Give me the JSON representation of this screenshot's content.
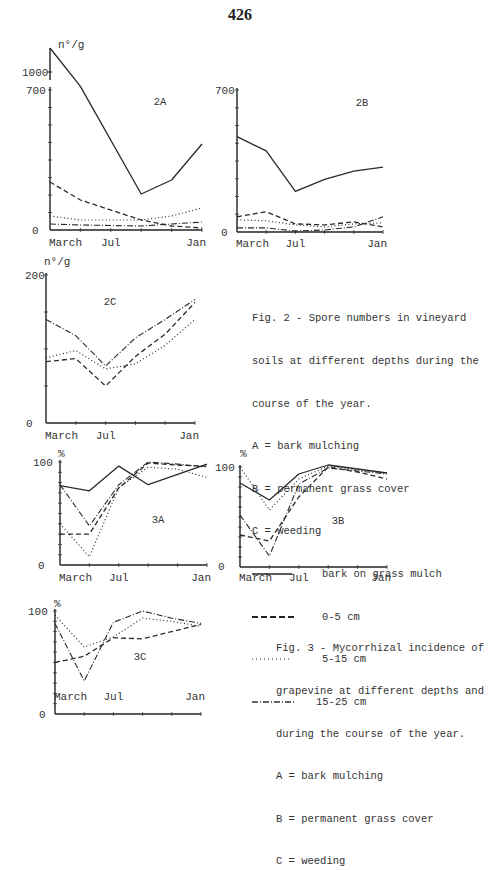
{
  "page": {
    "number": "426"
  },
  "legend_styles": [
    {
      "key": "bark",
      "label": "bark on grass mulch",
      "dash": "",
      "width": 1.3
    },
    {
      "key": "d0_5",
      "label": "0-5 cm",
      "dash": "5,3",
      "width": 1.3
    },
    {
      "key": "d5_15",
      "label": "5-15 cm",
      "dash": "1,2.5",
      "width": 1.2
    },
    {
      "key": "d15_25",
      "label": "15-25 cm",
      "dash": "6,2,1,2",
      "width": 1.1
    }
  ],
  "fig2_caption": {
    "lines": [
      "Fig. 2 - Spore numbers in vineyard",
      "soils at different depths during the",
      "course of the year.",
      "A = bark mulching",
      "B = permanent grass cover",
      "C = weeding"
    ],
    "legend": [
      {
        "label": "bark on grass mulch"
      },
      {
        "label": "0-5 cm"
      },
      {
        "label": "5-15 cm"
      },
      {
        "label": "15-25 cm"
      }
    ]
  },
  "fig3_caption": {
    "lines": [
      "Fig. 3 - Mycorrhizal incidence of",
      "grapevine at different depths and",
      "during the course of the year.",
      "A = bark mulching",
      "B = permanent grass cover",
      "C = weeding"
    ]
  },
  "chart_data": [
    {
      "id": "2A",
      "type": "line",
      "title": "2A",
      "ylabel": "n°/g",
      "xlabel": "",
      "x_ticks": [
        "March",
        "Jul",
        "Jan"
      ],
      "y_ticks": [
        "0",
        "700",
        "1000"
      ],
      "ylim": [
        0,
        1100
      ],
      "grid": false,
      "x": [
        0,
        1,
        2,
        3,
        4,
        5
      ],
      "series": [
        {
          "name": "bark on grass mulch",
          "values": [
            1100,
            760,
            null,
            180,
            250,
            430
          ]
        },
        {
          "name": "0-5 cm",
          "values": [
            240,
            150,
            null,
            50,
            20,
            10
          ]
        },
        {
          "name": "5-15 cm",
          "values": [
            70,
            50,
            null,
            50,
            70,
            110
          ]
        },
        {
          "name": "15-25 cm",
          "values": [
            30,
            25,
            null,
            20,
            30,
            40
          ]
        }
      ],
      "notes": "Axis break between 700 and 1000; bark series starts at ~1100 and descends through 1000 to ~760"
    },
    {
      "id": "2B",
      "type": "line",
      "title": "2B",
      "ylabel": "",
      "x_ticks": [
        "March",
        "Jul",
        "Jan"
      ],
      "y_ticks": [
        "0",
        "700"
      ],
      "ylim": [
        0,
        700
      ],
      "grid": false,
      "x": [
        0,
        1,
        2,
        3,
        4,
        5
      ],
      "series": [
        {
          "name": "bark on grass mulch",
          "values": [
            470,
            400,
            200,
            260,
            300,
            320
          ]
        },
        {
          "name": "0-5 cm",
          "values": [
            75,
            100,
            40,
            35,
            50,
            25
          ]
        },
        {
          "name": "5-15 cm",
          "values": [
            60,
            55,
            35,
            25,
            40,
            45
          ]
        },
        {
          "name": "15-25 cm",
          "values": [
            20,
            20,
            5,
            10,
            25,
            75
          ]
        }
      ]
    },
    {
      "id": "2C",
      "type": "line",
      "title": "2C",
      "ylabel": "n°/g",
      "x_ticks": [
        "March",
        "Jul",
        "Jan"
      ],
      "y_ticks": [
        "0",
        "200"
      ],
      "ylim": [
        0,
        200
      ],
      "grid": false,
      "x": [
        0,
        1,
        2,
        3,
        4,
        5
      ],
      "series": [
        {
          "name": "0-5 cm",
          "values": [
            83,
            87,
            50,
            90,
            120,
            163
          ]
        },
        {
          "name": "5-15 cm",
          "values": [
            88,
            98,
            73,
            80,
            105,
            140
          ]
        },
        {
          "name": "15-25 cm",
          "values": [
            140,
            118,
            77,
            115,
            140,
            167
          ]
        }
      ]
    },
    {
      "id": "3A",
      "type": "line",
      "title": "3A",
      "ylabel": "%",
      "x_ticks": [
        "March",
        "Jul",
        "Jan"
      ],
      "y_ticks": [
        "0",
        "100"
      ],
      "ylim": [
        0,
        100
      ],
      "grid": false,
      "x": [
        0,
        1,
        2,
        3,
        4,
        5
      ],
      "series": [
        {
          "name": "bark on grass mulch",
          "values": [
            77,
            72,
            96,
            78,
            88,
            98
          ]
        },
        {
          "name": "0-5 cm",
          "values": [
            30,
            30,
            75,
            99,
            97,
            96
          ]
        },
        {
          "name": "5-15 cm",
          "values": [
            40,
            8,
            75,
            95,
            93,
            85
          ]
        },
        {
          "name": "15-25 cm",
          "values": [
            78,
            38,
            78,
            100,
            98,
            95
          ]
        }
      ]
    },
    {
      "id": "3B",
      "type": "line",
      "title": "3B",
      "ylabel": "%",
      "x_ticks": [
        "March",
        "Jul",
        "Jan"
      ],
      "y_ticks": [
        "0",
        "100"
      ],
      "ylim": [
        0,
        100
      ],
      "grid": false,
      "x": [
        0,
        1,
        2,
        3,
        4,
        5
      ],
      "series": [
        {
          "name": "bark on grass mulch",
          "values": [
            84,
            67,
            93,
            102,
            98,
            94
          ]
        },
        {
          "name": "0-5 cm",
          "values": [
            32,
            26,
            70,
            100,
            95,
            88
          ]
        },
        {
          "name": "5-15 cm",
          "values": [
            100,
            57,
            88,
            101,
            97,
            94
          ]
        },
        {
          "name": "15-25 cm",
          "values": [
            52,
            11,
            83,
            99,
            96,
            93
          ]
        }
      ]
    },
    {
      "id": "3C",
      "type": "line",
      "title": "3C",
      "ylabel": "%",
      "x_ticks": [
        "March",
        "Jul",
        "Jan"
      ],
      "y_ticks": [
        "0",
        "100"
      ],
      "ylim": [
        0,
        100
      ],
      "grid": false,
      "x": [
        0,
        1,
        2,
        3,
        4,
        5
      ],
      "series": [
        {
          "name": "0-5 cm",
          "values": [
            50,
            56,
            74,
            73,
            80,
            87
          ]
        },
        {
          "name": "5-15 cm",
          "values": [
            96,
            65,
            75,
            93,
            90,
            85
          ]
        },
        {
          "name": "15-25 cm",
          "values": [
            88,
            32,
            89,
            100,
            93,
            88
          ]
        }
      ]
    }
  ]
}
